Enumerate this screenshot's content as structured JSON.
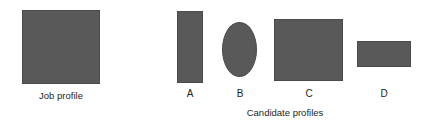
{
  "figure": {
    "width": 430,
    "height": 127,
    "background_color": "#ffffff",
    "shape_fill_color": "#595959",
    "shape_stroke_color": "#4a4a4a",
    "text_color": "#231f20"
  },
  "job_profile": {
    "caption": "Job profile",
    "shape": "square"
  },
  "candidates": {
    "group_caption": "Candidate profiles",
    "items": [
      {
        "label": "A",
        "shape": "rectangle-tall"
      },
      {
        "label": "B",
        "shape": "ellipse"
      },
      {
        "label": "C",
        "shape": "rectangle-large"
      },
      {
        "label": "D",
        "shape": "rectangle-wide"
      }
    ]
  },
  "chart_data": {
    "type": "diagram",
    "title": "",
    "reference": {
      "label": "Job profile",
      "shape": "square",
      "width_px": 78,
      "height_px": 74
    },
    "categories": [
      "A",
      "B",
      "C",
      "D"
    ],
    "series": [
      {
        "name": "width_px",
        "values": [
          26,
          35,
          69,
          54
        ]
      },
      {
        "name": "height_px",
        "values": [
          72,
          55,
          62,
          26
        ]
      }
    ],
    "shapes": [
      "rectangle-tall",
      "ellipse",
      "rectangle-large",
      "rectangle-wide"
    ],
    "xlabel": "Candidate profiles",
    "ylabel": "",
    "grid": false,
    "legend": "none"
  }
}
